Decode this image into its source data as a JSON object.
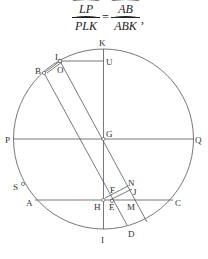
{
  "equation": {
    "lhs_num": "LP",
    "lhs_den": "PLK",
    "equals": "=",
    "rhs_num": "AB",
    "rhs_den": "ABK",
    "trail": ","
  },
  "diagram": {
    "labels": {
      "K": "K",
      "L": "L",
      "U": "U",
      "B": "B",
      "O": "O",
      "G": "G",
      "P": "P",
      "Q": "Q",
      "S": "S",
      "N": "N",
      "F": "F",
      "J": "J",
      "A": "A",
      "H": "H",
      "E": "E",
      "M": "M",
      "C": "C",
      "I": "I",
      "D": "D"
    },
    "stroke_color": "#555555"
  }
}
